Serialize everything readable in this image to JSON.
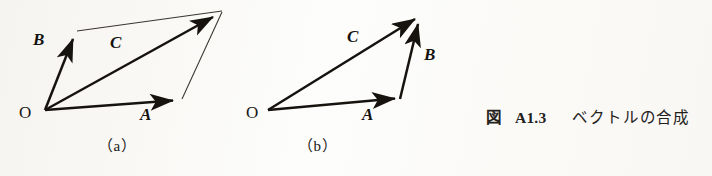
{
  "figure": {
    "caption": {
      "fig_word": "図",
      "number": "A1.3",
      "text": "ベクトルの合成",
      "full": "図 A1.3　ベクトルの合成"
    },
    "panels": [
      {
        "id": "a",
        "sub_caption": "（a）",
        "type": "parallelogram-law",
        "origin_label": "O",
        "vectors": [
          {
            "name": "A",
            "label": "A",
            "from": [
              45,
              110
            ],
            "to": [
              178,
              100
            ],
            "style": "bold-arrow"
          },
          {
            "name": "B",
            "label": "B",
            "from": [
              45,
              110
            ],
            "to": [
              75,
              33
            ],
            "style": "bold-arrow"
          },
          {
            "name": "C",
            "label": "C",
            "from": [
              45,
              110
            ],
            "to": [
              218,
              14
            ],
            "style": "bold-arrow"
          }
        ],
        "construction_lines": [
          {
            "from": [
              77,
              31
            ],
            "to": [
              222,
              11
            ]
          },
          {
            "from": [
              222,
              12
            ],
            "to": [
              182,
              99
            ]
          }
        ],
        "label_positions": {
          "A": [
            140,
            113
          ],
          "B": [
            33,
            37
          ],
          "C": [
            110,
            40
          ],
          "O": [
            19,
            105
          ]
        }
      },
      {
        "id": "b",
        "sub_caption": "（b）",
        "type": "triangle-law",
        "origin_label": "O",
        "vectors": [
          {
            "name": "A",
            "label": "A",
            "from": [
              268,
              110
            ],
            "to": [
              400,
              98
            ],
            "style": "bold-arrow"
          },
          {
            "name": "B",
            "label": "B",
            "from": [
              400,
              99
            ],
            "to": [
              420,
              17
            ],
            "style": "bold-arrow"
          },
          {
            "name": "C",
            "label": "C",
            "from": [
              268,
              110
            ],
            "to": [
              420,
              16
            ],
            "style": "bold-arrow"
          }
        ],
        "construction_lines": [],
        "label_positions": {
          "A": [
            363,
            113
          ],
          "B": [
            424,
            52
          ],
          "C": [
            348,
            34
          ],
          "O": [
            246,
            105
          ]
        }
      }
    ],
    "colors": {
      "ink": "#16130f",
      "thin_line": "#3a352e",
      "paper": "#fdfdfb"
    }
  }
}
